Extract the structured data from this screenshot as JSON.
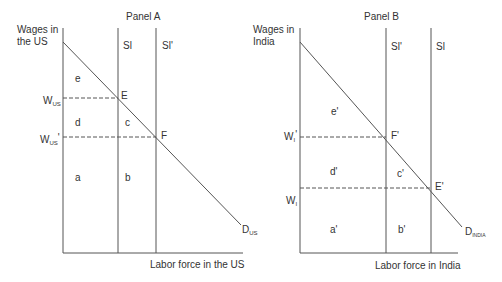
{
  "panel_a": {
    "title": "Panel A",
    "ylabel_line1": "Wages in",
    "ylabel_line2": "the US",
    "xlabel": "Labor force in the US",
    "supply1": "Sl",
    "supply2": "Sl'",
    "demand_main": "D",
    "demand_sub": "US",
    "wage1_main": "W",
    "wage1_sub": "US",
    "wage2_main": "W",
    "wage2_sub": "US",
    "wage2_prime": "'",
    "point1": "E",
    "point2": "F",
    "areas": {
      "a": "a",
      "b": "b",
      "c": "c",
      "d": "d",
      "e": "e"
    }
  },
  "panel_b": {
    "title": "Panel B",
    "ylabel_line1": "Wages in",
    "ylabel_line2": "India",
    "xlabel": "Labor force in India",
    "supply1": "Sl'",
    "supply2": "Sl",
    "demand_main": "D",
    "demand_sub": "INDIA",
    "wage1_main": "W",
    "wage1_sub": "I",
    "wage1_prime": "'",
    "wage2_main": "W",
    "wage2_sub": "I",
    "point1": "F'",
    "point2": "E'",
    "areas": {
      "a": "a'",
      "b": "b'",
      "c": "c'",
      "d": "d'",
      "e": "e'"
    }
  },
  "colors": {
    "line": "#555555",
    "text": "#333333"
  }
}
